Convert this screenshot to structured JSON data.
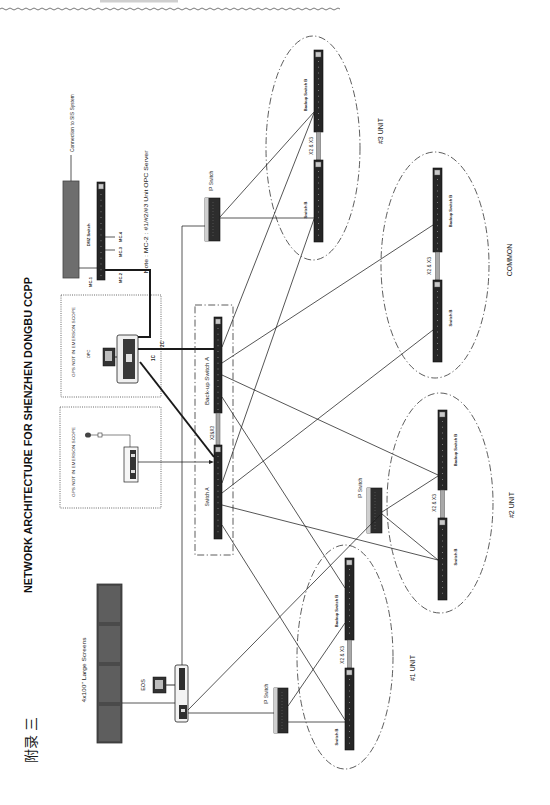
{
  "appendix_label": "附录 三",
  "title": "NETWORK ARCHITECTURE FOR  SHENZHEN DONGBU  CCPP",
  "note": "Note : MC-2 : #1/#2/#3 Unit OPC Server",
  "sis_connection": "Connection to SIS System",
  "dmz": {
    "label": "DMZ Switch",
    "ports": [
      "MC-1",
      "MC-2",
      "MC-3",
      "MC-4"
    ]
  },
  "gps_boxes": [
    {
      "label": "GPS NOT IN EMERSON SCOPE",
      "device": "OPC"
    },
    {
      "label": "GPS NOT IN EMERSON SCOPE"
    }
  ],
  "links": {
    "c1": "1C",
    "c2": "2C"
  },
  "core": {
    "backup_switch_a": "Back-up Switch A",
    "switch_a": "Switch A",
    "interlink": "X2&X3"
  },
  "eos": "EOS",
  "large_screens": "4x100''  Large Screens",
  "ip_switch": "IP Switch",
  "units": [
    {
      "name": "#3 UNIT",
      "backup": "Backup Switch B",
      "switch": "Switch B",
      "interlink": "X2 & X3"
    },
    {
      "name": "COMMON",
      "backup": "Backup Switch B",
      "switch": "Switch B",
      "interlink": "X2 & X3"
    },
    {
      "name": "#2 UNIT",
      "backup": "Backup Switch B",
      "switch": "Switch B",
      "interlink": "X2 & X3"
    },
    {
      "name": "#1 UNIT",
      "backup": "Backup Switch B",
      "switch": "Switch B",
      "interlink": "X2 & X3"
    }
  ],
  "colors": {
    "switch_body": "#262626",
    "screen_panel": "#5c5c5c",
    "firewall_box": "#6e6e6e",
    "line": "#1e1e1e"
  }
}
